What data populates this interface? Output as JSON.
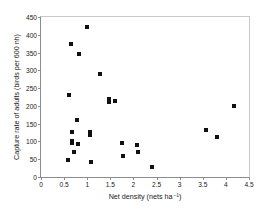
{
  "chart_data": {
    "type": "scatter",
    "title": "",
    "xlabel": "Net density (nets ha⁻¹)",
    "ylabel": "Capture rate of adults (birds per 600 nh)",
    "xlim": [
      0,
      4.5
    ],
    "ylim": [
      0,
      450
    ],
    "xticks": [
      0,
      0.5,
      1,
      1.5,
      2,
      2.5,
      3,
      3.5,
      4,
      4.5
    ],
    "xtick_labels": [
      "0",
      "0.5",
      "1",
      "1.5",
      "2",
      "2.5",
      "3",
      "3.5",
      "4",
      "4.5"
    ],
    "yticks": [
      0,
      50,
      100,
      150,
      200,
      250,
      300,
      350,
      400,
      450
    ],
    "ytick_labels": [
      "0",
      "50",
      "100",
      "150",
      "200",
      "250",
      "300",
      "350",
      "400",
      "450"
    ],
    "grid": false,
    "legend": false,
    "marker": "square",
    "marker_color": "#111111",
    "series": [
      {
        "name": "Capture rate",
        "points": [
          [
            0.58,
            48
          ],
          [
            0.6,
            231
          ],
          [
            0.65,
            374
          ],
          [
            0.66,
            126
          ],
          [
            0.68,
            102
          ],
          [
            0.68,
            96
          ],
          [
            0.72,
            70
          ],
          [
            0.78,
            160
          ],
          [
            0.8,
            93
          ],
          [
            0.82,
            347
          ],
          [
            1.0,
            423
          ],
          [
            1.05,
            127
          ],
          [
            1.05,
            118
          ],
          [
            1.08,
            41
          ],
          [
            1.28,
            289
          ],
          [
            1.47,
            218
          ],
          [
            1.48,
            212
          ],
          [
            1.6,
            213
          ],
          [
            1.76,
            97
          ],
          [
            1.78,
            59
          ],
          [
            2.08,
            91
          ],
          [
            2.1,
            69
          ],
          [
            2.4,
            29
          ],
          [
            3.57,
            131
          ],
          [
            3.8,
            113
          ],
          [
            4.18,
            199
          ]
        ]
      }
    ]
  }
}
